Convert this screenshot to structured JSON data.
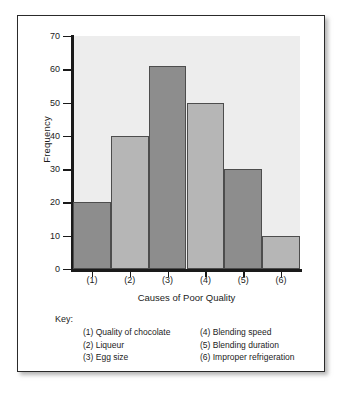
{
  "chart_data": {
    "type": "bar",
    "title": "",
    "xlabel": "Causes of Poor Quality",
    "ylabel": "Frequency",
    "categories": [
      "(1)",
      "(2)",
      "(3)",
      "(4)",
      "(5)",
      "(6)"
    ],
    "values": [
      20,
      40,
      61,
      50,
      30,
      10
    ],
    "ylim": [
      0,
      70
    ],
    "ytick_step": 10,
    "yticks": [
      0,
      10,
      20,
      30,
      40,
      50,
      60,
      70
    ],
    "grid": false,
    "legend_position": "below-axes",
    "bar_colors": [
      "#8d8d8d",
      "#b6b6b6",
      "#8d8d8d",
      "#b6b6b6",
      "#8d8d8d",
      "#b6b6b6"
    ],
    "plot_background": "#ededed",
    "axis_color": "#1a1a1a",
    "bar_edge_color": "#4d4d4d"
  },
  "key": {
    "title": "Key:",
    "left_column": [
      "(1) Quality of chocolate",
      "(2) Liqueur",
      "(3) Egg size"
    ],
    "right_column": [
      "(4) Blending speed",
      "(5) Blending duration",
      "(6) Improper refrigeration"
    ]
  }
}
